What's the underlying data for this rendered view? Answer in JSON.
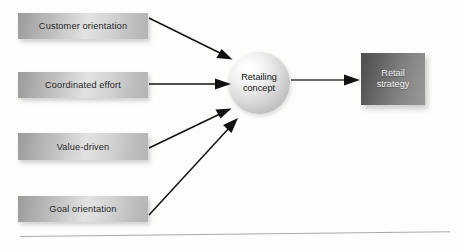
{
  "diagram": {
    "background_color": "#fdfdfc",
    "inputs": [
      {
        "label": "Customer orientation"
      },
      {
        "label": "Coordinated effort"
      },
      {
        "label": "Value-driven"
      },
      {
        "label": "Goal orientation"
      }
    ],
    "hub": {
      "line1": "Retailing",
      "line2": "concept"
    },
    "output": {
      "line1": "Retail",
      "line2": "strategy"
    },
    "arrows": [
      {
        "name": "customer-orientation-to-hub",
        "from": "Customer orientation",
        "to": "Retailing concept"
      },
      {
        "name": "coordinated-effort-to-hub",
        "from": "Coordinated effort",
        "to": "Retailing concept"
      },
      {
        "name": "value-driven-to-hub",
        "from": "Value-driven",
        "to": "Retailing concept"
      },
      {
        "name": "goal-orientation-to-hub",
        "from": "Goal orientation",
        "to": "Retailing concept"
      },
      {
        "name": "hub-to-retail-strategy",
        "from": "Retailing concept",
        "to": "Retail strategy"
      }
    ],
    "colors": {
      "input_box_fill": "#c2c2c2",
      "hub_fill": "#d6d6d6",
      "output_box_fill": "#6d6d6d",
      "arrow_stroke": "#111111",
      "rule_color": "#a9a9a9",
      "input_text": "#1b1b1b",
      "output_text": "#f2f2f2"
    }
  }
}
